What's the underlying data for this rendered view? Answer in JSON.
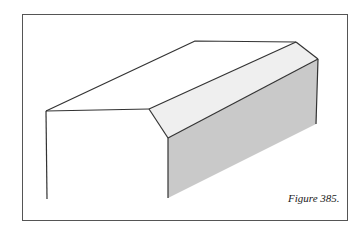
{
  "figure": {
    "caption": "Figure 385.",
    "colors": {
      "stroke": "#333333",
      "chamfer_face": "#efefef",
      "side_face": "#c9c9c9",
      "frame": "#555555"
    }
  }
}
